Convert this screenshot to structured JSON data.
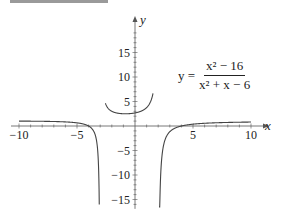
{
  "chart_data": {
    "type": "line",
    "title": "",
    "function": "y = (x^2 - 16) / (x^2 + x - 6)",
    "equation_label": {
      "lhs": "y =",
      "numerator": "x² − 16",
      "denominator": "x² + x − 6"
    },
    "xlabel": "x",
    "ylabel": "y",
    "xlim": [
      -10,
      10
    ],
    "ylim": [
      -16.5,
      20
    ],
    "x_ticks": [
      -10,
      -5,
      5,
      10
    ],
    "x_tick_labels": [
      "−10",
      "−5",
      "5",
      "10"
    ],
    "y_ticks": [
      -15,
      -10,
      -5,
      5,
      10,
      15
    ],
    "y_tick_labels": [
      "−15",
      "−10",
      "−5",
      "5",
      "10",
      "15"
    ],
    "vertical_asymptotes": [
      -3,
      2
    ],
    "horizontal_asymptote": 1,
    "grid": false,
    "legend": null,
    "series": [
      {
        "name": "left branch",
        "x_range": [
          -10,
          -3.08
        ]
      },
      {
        "name": "middle branch",
        "x_range": [
          -2.55,
          1.55
        ]
      },
      {
        "name": "right branch",
        "x_range": [
          2.07,
          10
        ]
      }
    ],
    "sample_points": [
      {
        "x": -10,
        "y": 1.2
      },
      {
        "x": -5,
        "y": 0.64
      },
      {
        "x": -4,
        "y": 0
      },
      {
        "x": -3.5,
        "y": -1.57
      },
      {
        "x": 0,
        "y": 2.67
      },
      {
        "x": 1,
        "y": 3.75
      },
      {
        "x": -2,
        "y": 3
      },
      {
        "x": 3,
        "y": -1.17
      },
      {
        "x": 4,
        "y": 0
      },
      {
        "x": 5,
        "y": 0.38
      },
      {
        "x": 10,
        "y": 0.8
      }
    ]
  },
  "layout": {
    "origin_px": [
      135,
      126
    ],
    "px_per_x": 11.6,
    "px_per_y": 4.9,
    "line_color": "#444444",
    "axis_color": "#555555"
  }
}
